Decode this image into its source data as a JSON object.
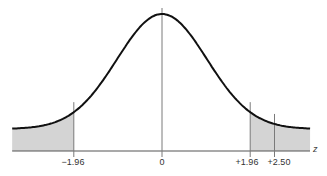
{
  "chart_data": {
    "type": "line",
    "title": "",
    "subtitle": "Standard normal distribution with shaded tail regions",
    "xlabel": "z",
    "ylabel": "",
    "xlim": [
      -3.33,
      3.29
    ],
    "grid": false,
    "legend": null,
    "series": [
      {
        "name": "standard normal density",
        "function": "N(0,1) pdf"
      }
    ],
    "tick_labels": [
      "-1.96",
      "0",
      "+1.96",
      "+2.50"
    ],
    "ticks": [
      -1.96,
      0,
      1.96,
      2.5
    ],
    "vertical_lines": [
      -1.96,
      0,
      1.96,
      2.5
    ],
    "shaded_regions": [
      {
        "from": -3.33,
        "to": -1.96,
        "color": "#d4d4d4"
      },
      {
        "from": 1.96,
        "to": 3.29,
        "color": "#d4d4d4"
      }
    ],
    "annotations": []
  },
  "labels": {
    "t_neg196": "−1.96",
    "t_0": "0",
    "t_pos196": "+1.96",
    "t_pos250": "+2.50",
    "axis": "z"
  },
  "colors": {
    "curve": "#111111",
    "shade": "#d4d4d4",
    "lines": "#7a7a7a",
    "axis": "#555555"
  }
}
